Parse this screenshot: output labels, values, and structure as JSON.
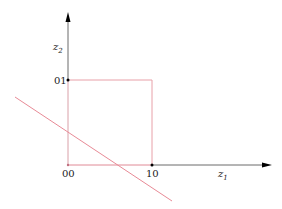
{
  "diagram": {
    "axes": {
      "x_label_main": "z",
      "x_label_sub": "1",
      "y_label_main": "z",
      "y_label_sub": "2"
    },
    "points": [
      {
        "label": "00",
        "x": 0,
        "y": 0
      },
      {
        "label": "10",
        "x": 1,
        "y": 0
      },
      {
        "label": "01",
        "x": 0,
        "y": 1
      }
    ],
    "shapes": {
      "unit_square": {
        "corners": [
          [
            0,
            0
          ],
          [
            1,
            0
          ],
          [
            1,
            1
          ],
          [
            0,
            1
          ]
        ],
        "color": "#e8a0a8"
      },
      "decision_line": {
        "from": [
          -0.63,
          0.8
        ],
        "to": [
          1.24,
          -0.42
        ],
        "color": "#e88a96"
      }
    },
    "colors": {
      "axis": "#000000",
      "red": "#e88a96"
    }
  }
}
